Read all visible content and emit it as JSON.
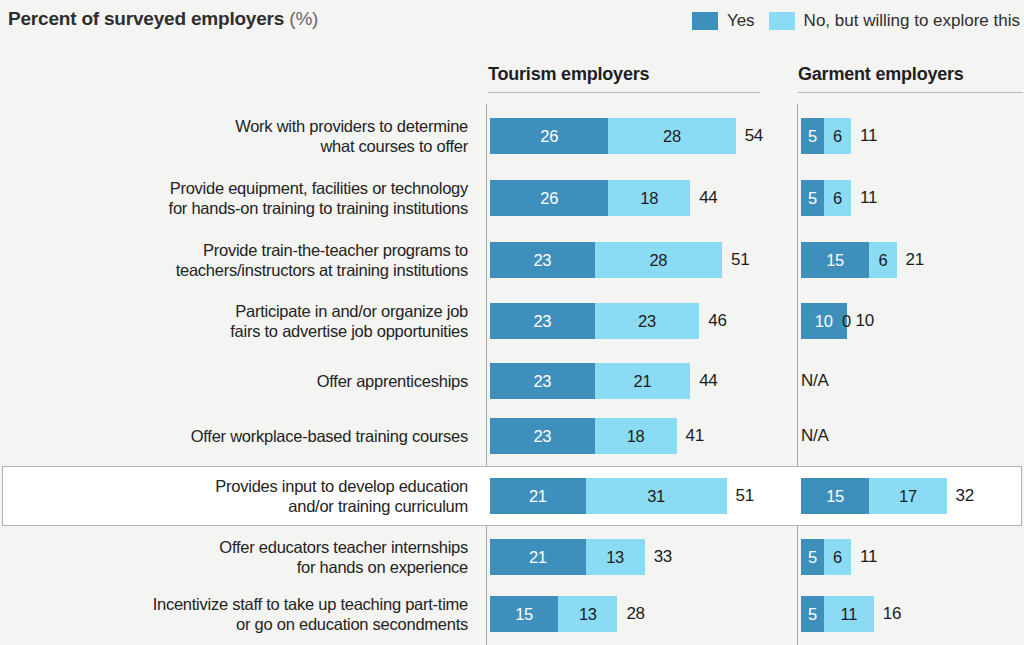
{
  "header": {
    "title": "Percent of surveyed employers",
    "title_unit": "(%)"
  },
  "legend": {
    "position": "top-right",
    "items": [
      {
        "label": "Yes",
        "color": "#3f8fbd",
        "icon": "legend-swatch-icon"
      },
      {
        "label": "No, but willing to explore this",
        "color": "#8bdbf4",
        "icon": "legend-swatch-icon"
      }
    ]
  },
  "columns": [
    {
      "key": "tourism",
      "header": "Tourism employers"
    },
    {
      "key": "garment",
      "header": "Garment employers"
    }
  ],
  "na_label": "N/A",
  "chart_data": {
    "type": "bar",
    "title": "Percent of surveyed employers (%)",
    "xlabel": "",
    "ylabel": "",
    "orientation": "horizontal",
    "stacked": true,
    "grid": false,
    "legend_position": "top-right",
    "xlim": [
      0,
      60
    ],
    "series": [
      {
        "name": "Yes",
        "color": "#3f8fbd"
      },
      {
        "name": "No, but willing to explore this",
        "color": "#8bdbf4"
      }
    ],
    "panels": [
      "Tourism employers",
      "Garment employers"
    ],
    "categories": [
      "Work with providers to determine what courses to offer",
      "Provide equipment, facilities or technology for hands-on training to training institutions",
      "Provide train-the-teacher programs to teachers/instructors at training institutions",
      "Participate in and/or organize job fairs to advertise job opportunities",
      "Offer apprenticeships",
      "Offer workplace-based training courses",
      "Provides input to develop education and/or training curriculum",
      "Offer educators teacher internships for hands on experience",
      "Incentivize staff to take up teaching part-time or go on education secondments"
    ],
    "rows": [
      {
        "label_lines": "Work with providers to determine\nwhat courses to offer",
        "highlighted": false,
        "tourism": {
          "yes": 26,
          "no": 28,
          "total": 54
        },
        "garment": {
          "yes": 5,
          "no": 6,
          "total": 11
        }
      },
      {
        "label_lines": "Provide equipment, facilities or technology\nfor hands-on training to training institutions",
        "highlighted": false,
        "tourism": {
          "yes": 26,
          "no": 18,
          "total": 44
        },
        "garment": {
          "yes": 5,
          "no": 6,
          "total": 11
        }
      },
      {
        "label_lines": "Provide train-the-teacher programs to\nteachers/instructors at training institutions",
        "highlighted": false,
        "tourism": {
          "yes": 23,
          "no": 28,
          "total": 51
        },
        "garment": {
          "yes": 15,
          "no": 6,
          "total": 21
        }
      },
      {
        "label_lines": "Participate in and/or organize job\nfairs to advertise job opportunities",
        "highlighted": false,
        "tourism": {
          "yes": 23,
          "no": 23,
          "total": 46
        },
        "garment": {
          "yes": 10,
          "no": 0,
          "total": 10
        }
      },
      {
        "label_lines": "Offer apprenticeships",
        "highlighted": false,
        "tourism": {
          "yes": 23,
          "no": 21,
          "total": 44
        },
        "garment": null
      },
      {
        "label_lines": "Offer workplace-based training courses",
        "highlighted": false,
        "tourism": {
          "yes": 23,
          "no": 18,
          "total": 41
        },
        "garment": null
      },
      {
        "label_lines": "Provides input to develop education\nand/or training curriculum",
        "highlighted": true,
        "tourism": {
          "yes": 21,
          "no": 31,
          "total": 51
        },
        "garment": {
          "yes": 15,
          "no": 17,
          "total": 32
        }
      },
      {
        "label_lines": "Offer educators teacher internships\nfor hands on experience",
        "highlighted": false,
        "tourism": {
          "yes": 21,
          "no": 13,
          "total": 33
        },
        "garment": {
          "yes": 5,
          "no": 6,
          "total": 11
        }
      },
      {
        "label_lines": "Incentivize staff to take up teaching part-time\nor go on education secondments",
        "highlighted": false,
        "tourism": {
          "yes": 15,
          "no": 13,
          "total": 28
        },
        "garment": {
          "yes": 5,
          "no": 11,
          "total": 16
        }
      }
    ]
  },
  "layout": {
    "scale_px_per_unit": 4.55,
    "row_tops": [
      118,
      180,
      242,
      303,
      363,
      418,
      478,
      539,
      596
    ],
    "bar_height": 36
  }
}
